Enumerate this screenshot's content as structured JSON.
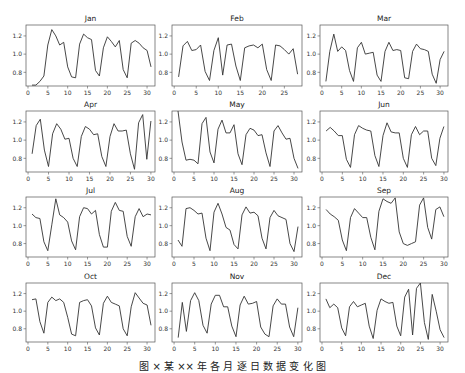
{
  "figure": {
    "caption": "图 ×  某 ×× 年 各 月 逐 日 数 据 变 化 图",
    "line_color": "#333333",
    "axes_color": "#555555"
  },
  "chart_data": [
    {
      "type": "line",
      "title": "Jan",
      "xticks": [
        0,
        5,
        10,
        15,
        20,
        25,
        30
      ],
      "yticks": [
        0.8,
        1.0,
        1.2
      ],
      "ylim": [
        0.65,
        1.32
      ],
      "xlim": [
        -0.5,
        32
      ],
      "x": [
        1,
        2,
        3,
        4,
        5,
        6,
        7,
        8,
        9,
        10,
        11,
        12,
        13,
        14,
        15,
        16,
        17,
        18,
        19,
        20,
        21,
        22,
        23,
        24,
        25,
        26,
        27,
        28,
        29,
        30,
        31
      ],
      "values": [
        0.66,
        0.66,
        0.7,
        0.76,
        1.1,
        1.27,
        1.2,
        1.1,
        1.13,
        0.86,
        0.75,
        0.74,
        1.11,
        1.22,
        1.18,
        1.16,
        0.82,
        0.76,
        1.07,
        1.19,
        1.14,
        1.08,
        1.15,
        0.83,
        0.74,
        1.12,
        1.15,
        1.12,
        1.07,
        1.04,
        0.86
      ]
    },
    {
      "type": "line",
      "title": "Feb",
      "xticks": [
        0,
        5,
        10,
        15,
        20,
        25
      ],
      "yticks": [
        0.8,
        1.0,
        1.2
      ],
      "ylim": [
        0.65,
        1.32
      ],
      "xlim": [
        -0.5,
        29
      ],
      "x": [
        1,
        2,
        3,
        4,
        5,
        6,
        7,
        8,
        9,
        10,
        11,
        12,
        13,
        14,
        15,
        16,
        17,
        18,
        19,
        20,
        21,
        22,
        23,
        24,
        25,
        26,
        27,
        28
      ],
      "values": [
        0.75,
        1.09,
        1.14,
        1.04,
        1.05,
        1.1,
        0.81,
        0.71,
        1.04,
        1.18,
        0.77,
        1.1,
        1.11,
        0.87,
        0.71,
        1.07,
        1.09,
        1.1,
        1.07,
        1.11,
        0.83,
        0.71,
        1.1,
        1.09,
        1.05,
        1.0,
        1.06,
        0.78
      ]
    },
    {
      "type": "line",
      "title": "Mar",
      "xticks": [
        0,
        5,
        10,
        15,
        20,
        25,
        30
      ],
      "yticks": [
        0.8,
        1.0,
        1.2
      ],
      "ylim": [
        0.65,
        1.32
      ],
      "xlim": [
        -0.5,
        32
      ],
      "x": [
        1,
        2,
        3,
        4,
        5,
        6,
        7,
        8,
        9,
        10,
        11,
        12,
        13,
        14,
        15,
        16,
        17,
        18,
        19,
        20,
        21,
        22,
        23,
        24,
        25,
        26,
        27,
        28,
        29,
        30,
        31
      ],
      "values": [
        0.7,
        1.03,
        1.22,
        1.03,
        1.08,
        1.04,
        0.82,
        0.7,
        1.07,
        1.13,
        1.0,
        1.01,
        1.02,
        0.77,
        0.7,
        1.03,
        1.13,
        1.04,
        1.05,
        1.04,
        0.74,
        0.73,
        1.03,
        1.11,
        1.06,
        1.05,
        1.03,
        0.78,
        0.68,
        0.94,
        1.03
      ]
    },
    {
      "type": "line",
      "title": "Apr",
      "xticks": [
        0,
        5,
        10,
        15,
        20,
        25,
        30
      ],
      "yticks": [
        0.8,
        1.0,
        1.2
      ],
      "ylim": [
        0.65,
        1.32
      ],
      "xlim": [
        -0.5,
        31
      ],
      "x": [
        1,
        2,
        3,
        4,
        5,
        6,
        7,
        8,
        9,
        10,
        11,
        12,
        13,
        14,
        15,
        16,
        17,
        18,
        19,
        20,
        21,
        22,
        23,
        24,
        25,
        26,
        27,
        28,
        29,
        30
      ],
      "values": [
        0.85,
        1.16,
        1.23,
        0.89,
        0.71,
        1.07,
        1.18,
        1.12,
        1.01,
        1.02,
        0.8,
        0.71,
        1.04,
        1.15,
        1.12,
        1.06,
        1.07,
        0.82,
        0.71,
        1.04,
        1.18,
        1.1,
        1.1,
        1.11,
        0.85,
        0.68,
        1.19,
        1.28,
        0.79,
        1.21
      ]
    },
    {
      "type": "line",
      "title": "May",
      "xticks": [
        0,
        5,
        10,
        15,
        20,
        25,
        30
      ],
      "yticks": [
        0.8,
        1.0,
        1.2
      ],
      "ylim": [
        0.65,
        1.32
      ],
      "xlim": [
        -0.5,
        32
      ],
      "x": [
        1,
        2,
        3,
        4,
        5,
        6,
        7,
        8,
        9,
        10,
        11,
        12,
        13,
        14,
        15,
        16,
        17,
        18,
        19,
        20,
        21,
        22,
        23,
        24,
        25,
        26,
        27,
        28,
        29,
        30,
        31
      ],
      "values": [
        1.32,
        0.98,
        0.78,
        0.79,
        0.78,
        0.74,
        1.18,
        1.25,
        0.87,
        0.75,
        1.12,
        1.22,
        1.08,
        1.08,
        1.17,
        0.85,
        0.73,
        1.06,
        1.13,
        1.11,
        1.05,
        1.06,
        0.86,
        0.71,
        1.1,
        1.16,
        1.08,
        1.01,
        1.02,
        0.8,
        0.69
      ]
    },
    {
      "type": "line",
      "title": "Jun",
      "xticks": [
        0,
        5,
        10,
        15,
        20,
        25,
        30
      ],
      "yticks": [
        0.8,
        1.0,
        1.2
      ],
      "ylim": [
        0.65,
        1.32
      ],
      "xlim": [
        -0.5,
        31
      ],
      "x": [
        1,
        2,
        3,
        4,
        5,
        6,
        7,
        8,
        9,
        10,
        11,
        12,
        13,
        14,
        15,
        16,
        17,
        18,
        19,
        20,
        21,
        22,
        23,
        24,
        25,
        26,
        27,
        28,
        29,
        30
      ],
      "values": [
        1.1,
        1.14,
        1.1,
        1.05,
        1.05,
        0.79,
        0.7,
        1.06,
        1.16,
        1.13,
        1.11,
        1.1,
        0.83,
        0.71,
        1.05,
        1.19,
        1.09,
        1.08,
        1.08,
        0.8,
        0.7,
        1.06,
        1.15,
        1.06,
        1.1,
        1.1,
        0.8,
        0.72,
        1.02,
        1.15
      ]
    },
    {
      "type": "line",
      "title": "Jul",
      "xticks": [
        0,
        5,
        10,
        15,
        20,
        25,
        30
      ],
      "yticks": [
        0.8,
        1.0,
        1.2
      ],
      "ylim": [
        0.65,
        1.32
      ],
      "xlim": [
        -0.5,
        32
      ],
      "x": [
        1,
        2,
        3,
        4,
        5,
        6,
        7,
        8,
        9,
        10,
        11,
        12,
        13,
        14,
        15,
        16,
        17,
        18,
        19,
        20,
        21,
        22,
        23,
        24,
        25,
        26,
        27,
        28,
        29,
        30,
        31
      ],
      "values": [
        1.13,
        1.09,
        1.08,
        0.82,
        0.72,
        1.01,
        1.3,
        1.12,
        1.09,
        1.04,
        0.83,
        0.73,
        1.1,
        1.2,
        1.19,
        1.13,
        1.17,
        0.9,
        0.76,
        0.76,
        1.16,
        1.26,
        1.17,
        1.16,
        0.88,
        0.77,
        1.1,
        1.19,
        1.1,
        1.13,
        1.12
      ]
    },
    {
      "type": "line",
      "title": "Aug",
      "xticks": [
        0,
        5,
        10,
        15,
        20,
        25,
        30
      ],
      "yticks": [
        0.8,
        1.0,
        1.2
      ],
      "ylim": [
        0.65,
        1.32
      ],
      "xlim": [
        -0.5,
        32
      ],
      "x": [
        1,
        2,
        3,
        4,
        5,
        6,
        7,
        8,
        9,
        10,
        11,
        12,
        13,
        14,
        15,
        16,
        17,
        18,
        19,
        20,
        21,
        22,
        23,
        24,
        25,
        26,
        27,
        28,
        29,
        30,
        31
      ],
      "values": [
        0.84,
        0.77,
        1.19,
        1.2,
        1.17,
        1.13,
        1.14,
        0.86,
        0.72,
        1.15,
        1.25,
        1.13,
        0.98,
        0.95,
        0.79,
        0.74,
        1.12,
        1.21,
        1.14,
        1.15,
        1.11,
        0.86,
        0.74,
        1.09,
        1.17,
        1.11,
        1.09,
        1.07,
        0.8,
        0.71,
        0.99
      ]
    },
    {
      "type": "line",
      "title": "Sep",
      "xticks": [
        0,
        5,
        10,
        15,
        20,
        25,
        30
      ],
      "yticks": [
        0.8,
        1.0,
        1.2
      ],
      "ylim": [
        0.65,
        1.32
      ],
      "xlim": [
        -0.5,
        31
      ],
      "x": [
        1,
        2,
        3,
        4,
        5,
        6,
        7,
        8,
        9,
        10,
        11,
        12,
        13,
        14,
        15,
        16,
        17,
        18,
        19,
        20,
        21,
        22,
        23,
        24,
        25,
        26,
        27,
        28,
        29,
        30
      ],
      "values": [
        1.18,
        1.13,
        1.1,
        1.06,
        0.84,
        0.72,
        1.09,
        1.19,
        1.14,
        1.09,
        1.09,
        0.87,
        0.73,
        1.16,
        1.3,
        1.27,
        1.25,
        1.31,
        0.93,
        0.8,
        0.78,
        0.8,
        0.82,
        1.23,
        1.31,
        0.98,
        0.85,
        1.18,
        1.21,
        1.1
      ]
    },
    {
      "type": "line",
      "title": "Oct",
      "xticks": [
        0,
        5,
        10,
        15,
        20,
        25,
        30
      ],
      "yticks": [
        0.8,
        1.0,
        1.2
      ],
      "ylim": [
        0.65,
        1.32
      ],
      "xlim": [
        -0.5,
        32
      ],
      "x": [
        1,
        2,
        3,
        4,
        5,
        6,
        7,
        8,
        9,
        10,
        11,
        12,
        13,
        14,
        15,
        16,
        17,
        18,
        19,
        20,
        21,
        22,
        23,
        24,
        25,
        26,
        27,
        28,
        29,
        30,
        31
      ],
      "values": [
        1.13,
        1.14,
        0.88,
        0.75,
        1.1,
        1.16,
        1.12,
        1.14,
        1.1,
        0.93,
        0.74,
        0.72,
        1.1,
        1.12,
        1.13,
        1.06,
        0.81,
        0.73,
        1.09,
        1.17,
        1.1,
        1.08,
        1.06,
        0.8,
        0.72,
        1.05,
        1.21,
        1.15,
        1.09,
        1.07,
        0.84
      ]
    },
    {
      "type": "line",
      "title": "Nov",
      "xticks": [
        0,
        5,
        10,
        15,
        20,
        25,
        30
      ],
      "yticks": [
        0.8,
        1.0,
        1.2
      ],
      "ylim": [
        0.65,
        1.32
      ],
      "xlim": [
        -0.5,
        31
      ],
      "x": [
        1,
        2,
        3,
        4,
        5,
        6,
        7,
        8,
        9,
        10,
        11,
        12,
        13,
        14,
        15,
        16,
        17,
        18,
        19,
        20,
        21,
        22,
        23,
        24,
        25,
        26,
        27,
        28,
        29,
        30
      ],
      "values": [
        0.7,
        1.1,
        0.77,
        1.12,
        1.21,
        1.12,
        0.84,
        0.75,
        1.08,
        1.18,
        1.18,
        1.05,
        1.05,
        0.83,
        0.71,
        1.07,
        1.17,
        1.08,
        1.09,
        1.11,
        0.82,
        0.74,
        0.71,
        1.06,
        1.14,
        1.08,
        1.08,
        0.82,
        0.71,
        1.04
      ]
    },
    {
      "type": "line",
      "title": "Dec",
      "xticks": [
        0,
        5,
        10,
        15,
        20,
        25,
        30
      ],
      "yticks": [
        0.8,
        1.0,
        1.2
      ],
      "ylim": [
        0.65,
        1.32
      ],
      "xlim": [
        -0.5,
        32
      ],
      "x": [
        1,
        2,
        3,
        4,
        5,
        6,
        7,
        8,
        9,
        10,
        11,
        12,
        13,
        14,
        15,
        16,
        17,
        18,
        19,
        20,
        21,
        22,
        23,
        24,
        25,
        26,
        27,
        28,
        29,
        30,
        31
      ],
      "values": [
        1.14,
        1.04,
        1.08,
        1.04,
        0.81,
        0.72,
        1.05,
        1.11,
        1.05,
        1.07,
        1.09,
        0.83,
        0.69,
        1.01,
        1.14,
        1.11,
        1.09,
        1.1,
        0.83,
        0.72,
        1.16,
        1.25,
        0.73,
        1.26,
        1.32,
        0.87,
        0.68,
        1.19,
        1.0,
        0.79,
        0.7
      ]
    }
  ]
}
